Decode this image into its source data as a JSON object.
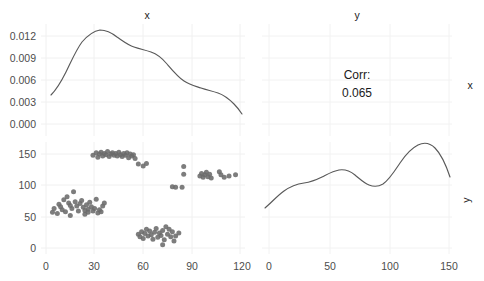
{
  "figure": {
    "type": "scatterplot-matrix",
    "background": "#ffffff",
    "point_color": "#6b6b6b",
    "line_color": "#595959",
    "grid_color": "#f2f2f2"
  },
  "panels": {
    "top_left": {
      "title": "x",
      "y_ticks": [
        "0.012",
        "0.009",
        "0.006",
        "0.003",
        "0.000"
      ],
      "kind": "density"
    },
    "top_right": {
      "title": "y",
      "corr_label": "Corr:",
      "corr_value": "0.065",
      "strip_label": "x",
      "kind": "correlation"
    },
    "bottom_left": {
      "y_ticks": [
        "150",
        "100",
        "50",
        "0"
      ],
      "x_ticks": [
        "0",
        "30",
        "60",
        "90",
        "120"
      ],
      "kind": "scatter"
    },
    "bottom_right": {
      "x_ticks": [
        "0",
        "50",
        "100",
        "150"
      ],
      "strip_label": "y",
      "kind": "density"
    }
  },
  "chart_data": {
    "type": "scatter",
    "title": "",
    "subtitle": "",
    "xlabel": "x",
    "ylabel": "y",
    "grid": true,
    "legend": "none",
    "variables": [
      "x",
      "y"
    ],
    "correlation": 0.065,
    "panels": [
      {
        "position": "diagonal-top-left",
        "type": "line",
        "variable": "x",
        "title": "x",
        "xlabel": "",
        "ylabel": "density",
        "xlim": [
          0,
          120
        ],
        "ylim": [
          0.0,
          0.0132
        ],
        "yticks": [
          0.0,
          0.003,
          0.006,
          0.009,
          0.012
        ],
        "series": [
          {
            "name": "density(x)",
            "x": [
              3,
              9,
              15,
              21,
              27,
              33,
              39,
              45,
              51,
              57,
              63,
              69,
              75,
              81,
              87,
              93,
              99,
              105,
              111,
              116
            ],
            "values": [
              0.004,
              0.0055,
              0.0075,
              0.0096,
              0.011,
              0.0118,
              0.0117,
              0.0112,
              0.0108,
              0.0107,
              0.0105,
              0.0099,
              0.0089,
              0.0078,
              0.0068,
              0.0062,
              0.0059,
              0.0055,
              0.0046,
              0.0034
            ]
          }
        ]
      },
      {
        "position": "upper-right",
        "type": "table",
        "title": "y",
        "strip": "x",
        "annotations": [
          "Corr:",
          "0.065"
        ],
        "values": [
          0.065
        ]
      },
      {
        "position": "lower-left",
        "type": "scatter",
        "title": "",
        "xlabel": "x",
        "ylabel": "y",
        "xlim": [
          0,
          122
        ],
        "ylim": [
          0,
          163
        ],
        "xticks": [
          0,
          30,
          60,
          90,
          120
        ],
        "yticks": [
          0,
          50,
          100,
          150
        ],
        "points": [
          [
            4,
            57
          ],
          [
            5,
            63
          ],
          [
            7,
            55
          ],
          [
            8,
            70
          ],
          [
            9,
            66
          ],
          [
            10,
            61
          ],
          [
            11,
            77
          ],
          [
            12,
            58
          ],
          [
            13,
            82
          ],
          [
            14,
            72
          ],
          [
            15,
            68
          ],
          [
            15,
            52
          ],
          [
            16,
            63
          ],
          [
            17,
            90
          ],
          [
            18,
            74
          ],
          [
            19,
            67
          ],
          [
            20,
            59
          ],
          [
            21,
            71
          ],
          [
            22,
            76
          ],
          [
            23,
            65
          ],
          [
            24,
            60
          ],
          [
            24,
            54
          ],
          [
            25,
            69
          ],
          [
            26,
            62
          ],
          [
            26,
            57
          ],
          [
            27,
            73
          ],
          [
            28,
            66
          ],
          [
            29,
            59
          ],
          [
            30,
            63
          ],
          [
            31,
            78
          ],
          [
            32,
            56
          ],
          [
            33,
            61
          ],
          [
            34,
            58
          ],
          [
            35,
            67
          ],
          [
            36,
            72
          ],
          [
            29,
            148
          ],
          [
            31,
            152
          ],
          [
            32,
            145
          ],
          [
            33,
            150
          ],
          [
            34,
            153
          ],
          [
            35,
            147
          ],
          [
            36,
            151
          ],
          [
            37,
            149
          ],
          [
            38,
            154
          ],
          [
            39,
            146
          ],
          [
            40,
            150
          ],
          [
            41,
            152
          ],
          [
            42,
            148
          ],
          [
            43,
            151
          ],
          [
            44,
            147
          ],
          [
            45,
            153
          ],
          [
            46,
            149
          ],
          [
            47,
            146
          ],
          [
            48,
            151
          ],
          [
            49,
            148
          ],
          [
            50,
            152
          ],
          [
            51,
            144
          ],
          [
            52,
            150
          ],
          [
            53,
            147
          ],
          [
            54,
            149
          ],
          [
            55,
            143
          ],
          [
            57,
            134
          ],
          [
            60,
            131
          ],
          [
            62,
            135
          ],
          [
            57,
            22
          ],
          [
            58,
            18
          ],
          [
            59,
            26
          ],
          [
            60,
            15
          ],
          [
            61,
            23
          ],
          [
            62,
            30
          ],
          [
            63,
            19
          ],
          [
            64,
            27
          ],
          [
            65,
            21
          ],
          [
            66,
            14
          ],
          [
            67,
            25
          ],
          [
            68,
            31
          ],
          [
            69,
            17
          ],
          [
            70,
            24
          ],
          [
            71,
            20
          ],
          [
            72,
            28
          ],
          [
            73,
            13
          ],
          [
            74,
            34
          ],
          [
            75,
            22
          ],
          [
            76,
            30
          ],
          [
            77,
            18
          ],
          [
            78,
            26
          ],
          [
            79,
            11
          ],
          [
            80,
            19
          ],
          [
            82,
            24
          ],
          [
            72,
            5
          ],
          [
            78,
            98
          ],
          [
            80,
            97
          ],
          [
            84,
            97
          ],
          [
            85,
            118
          ],
          [
            85,
            130
          ],
          [
            95,
            115
          ],
          [
            96,
            119
          ],
          [
            97,
            113
          ],
          [
            98,
            117
          ],
          [
            99,
            121
          ],
          [
            100,
            114
          ],
          [
            101,
            118
          ],
          [
            102,
            112
          ],
          [
            107,
            122
          ],
          [
            108,
            117
          ],
          [
            110,
            113
          ],
          [
            113,
            115
          ],
          [
            117,
            117
          ]
        ]
      },
      {
        "position": "diagonal-bottom-right",
        "type": "line",
        "variable": "y",
        "title": "",
        "strip": "y",
        "xlabel": "y",
        "ylabel": "density",
        "xlim": [
          0,
          163
        ],
        "xticks": [
          0,
          50,
          100,
          150
        ],
        "series": [
          {
            "name": "density(y)",
            "x": [
              3,
              12,
              22,
              32,
              42,
              52,
              62,
              72,
              82,
              92,
              102,
              112,
              122,
              132,
              140,
              148,
              157
            ],
            "values": [
              0.22,
              0.38,
              0.5,
              0.55,
              0.58,
              0.64,
              0.7,
              0.66,
              0.57,
              0.54,
              0.58,
              0.72,
              0.88,
              0.97,
              0.99,
              0.92,
              0.75
            ]
          }
        ]
      }
    ]
  }
}
